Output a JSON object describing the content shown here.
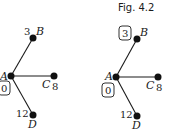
{
  "caption": "Fig. 4.2",
  "graphs": [
    {
      "nodes": {
        "A": {
          "label": "A",
          "value": "0",
          "boxed": true
        },
        "B": {
          "label": "B",
          "value": "3",
          "boxed": false
        },
        "C": {
          "label": "C",
          "value": "8",
          "boxed": false
        },
        "D": {
          "label": "D",
          "value": "12",
          "boxed": false
        }
      },
      "edges": [
        [
          "A",
          "B"
        ],
        [
          "A",
          "C"
        ],
        [
          "A",
          "D"
        ]
      ]
    },
    {
      "nodes": {
        "A": {
          "label": "A",
          "value": "0",
          "boxed": true
        },
        "B": {
          "label": "B",
          "value": "3",
          "boxed": true
        },
        "C": {
          "label": "C",
          "value": "8",
          "boxed": false
        },
        "D": {
          "label": "D",
          "value": "12",
          "boxed": false
        }
      },
      "edges": [
        [
          "A",
          "B"
        ],
        [
          "A",
          "C"
        ],
        [
          "A",
          "D"
        ]
      ]
    }
  ]
}
